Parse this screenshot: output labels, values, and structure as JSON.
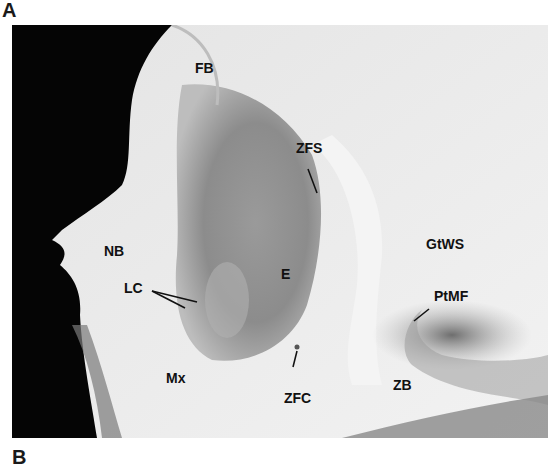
{
  "figure": {
    "panel_top": "A",
    "panel_bottom": "B"
  },
  "labels": [
    {
      "id": "FB",
      "text": "FB",
      "x": 183,
      "y": 36
    },
    {
      "id": "ZFS",
      "text": "ZFS",
      "x": 296,
      "y": 134
    },
    {
      "id": "NB",
      "text": "NB",
      "x": 92,
      "y": 219
    },
    {
      "id": "E",
      "text": "E",
      "x": 269,
      "y": 242
    },
    {
      "id": "GtWS",
      "text": "GtWS",
      "x": 414,
      "y": 212
    },
    {
      "id": "LC",
      "text": "LC",
      "x": 112,
      "y": 282
    },
    {
      "id": "PtMF",
      "text": "PtMF",
      "x": 422,
      "y": 278
    },
    {
      "id": "Mx",
      "text": "Mx",
      "x": 154,
      "y": 346
    },
    {
      "id": "ZFC",
      "text": "ZFC",
      "x": 286,
      "y": 364
    },
    {
      "id": "ZB",
      "text": "ZB",
      "x": 381,
      "y": 353
    }
  ],
  "colors": {
    "background_black": "#050505",
    "bone_light": "#ededed",
    "bone_mid": "#c9c9c9",
    "shadow": "#8a8a8a",
    "label": "#111111"
  }
}
